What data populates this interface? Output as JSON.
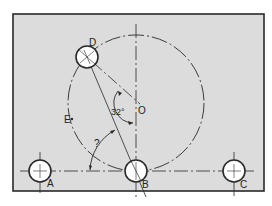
{
  "diagram": {
    "type": "engineering-drawing",
    "colors": {
      "plate": "#dcdcdc",
      "line": "#2a2a2a",
      "hole": "#ffffff"
    },
    "labels": {
      "hole_a": "A",
      "hole_b": "B",
      "hole_c": "C",
      "hole_d": "D",
      "point_e": "E",
      "center_o": "O",
      "angle_known": "32°",
      "angle_unknown": "?"
    }
  }
}
